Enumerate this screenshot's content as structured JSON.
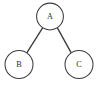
{
  "figure": {
    "background_color": "#ffffff",
    "stroke_color": "#3c3c3c",
    "label_color": "#2e2e2e"
  },
  "nodes": [
    {
      "id": "A",
      "label": "A",
      "cx": 50,
      "cy": 16.5,
      "r": 13.4,
      "role": "root"
    },
    {
      "id": "B",
      "label": "B",
      "cx": 19,
      "cy": 64.5,
      "r": 14.0,
      "role": "left-child"
    },
    {
      "id": "C",
      "label": "C",
      "cx": 79,
      "cy": 64.5,
      "r": 14.0,
      "role": "right-child"
    }
  ],
  "edges": [
    {
      "id": "A-B",
      "from": "A",
      "to": "B",
      "x1": 42.6,
      "y1": 27.8,
      "x2": 26.5,
      "y2": 53.3
    },
    {
      "id": "A-C",
      "from": "A",
      "to": "C",
      "x1": 57.4,
      "y1": 27.8,
      "x2": 71.5,
      "y2": 53.3
    }
  ]
}
